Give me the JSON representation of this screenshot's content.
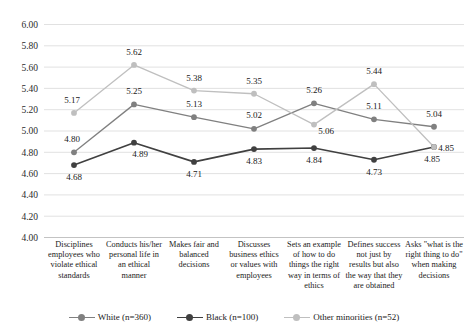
{
  "chart_data": {
    "type": "line",
    "title": "",
    "xlabel": "",
    "ylabel": "",
    "ylim": [
      4.0,
      6.0
    ],
    "ytick_step": 0.2,
    "grid": true,
    "legend_position": "bottom",
    "yticks": [
      "6.00",
      "5.80",
      "5.60",
      "5.40",
      "5.20",
      "5.00",
      "4.80",
      "4.60",
      "4.40",
      "4.20",
      "4.00"
    ],
    "categories": [
      "Disciplines employees who violate ethical standards",
      "Conducts his/her personal life in an ethical manner",
      "Makes fair and balanced decisions",
      "Discusses business ethics or values with employees",
      "Sets an example of how to do things the right way in terms of ethics",
      "Defines success not just by results but also the way that they are obtained",
      "Asks \"what is the right thing to do\" when making decisions"
    ],
    "series": [
      {
        "name": "White (n=360)",
        "color": "#808080",
        "values": [
          4.8,
          5.25,
          5.13,
          5.02,
          5.26,
          5.11,
          5.04
        ],
        "labels": [
          "4.80",
          "5.25",
          "5.13",
          "5.02",
          "5.26",
          "5.11",
          "5.04"
        ]
      },
      {
        "name": "Black (n=100)",
        "color": "#404040",
        "values": [
          4.68,
          4.89,
          4.71,
          4.83,
          4.84,
          4.73,
          4.85
        ],
        "labels": [
          "4.68",
          "4.89",
          "4.71",
          "4.83",
          "4.84",
          "4.73",
          "4.85"
        ]
      },
      {
        "name": "Other minorities (n=52)",
        "color": "#bfbfbf",
        "values": [
          5.17,
          5.62,
          5.38,
          5.35,
          5.06,
          5.44,
          4.85
        ],
        "labels": [
          "5.17",
          "5.62",
          "5.38",
          "5.35",
          "5.06",
          "5.44",
          "4.85"
        ]
      }
    ],
    "label_offsets": [
      [
        [
          -2,
          -10
        ],
        [
          0,
          -10
        ],
        [
          0,
          -10
        ],
        [
          0,
          -11
        ],
        [
          0,
          -10
        ],
        [
          0,
          -10
        ],
        [
          0,
          -10
        ]
      ],
      [
        [
          0,
          15
        ],
        [
          6,
          14
        ],
        [
          0,
          15
        ],
        [
          0,
          15
        ],
        [
          0,
          15
        ],
        [
          0,
          15
        ],
        [
          -2,
          15
        ]
      ],
      [
        [
          -2,
          -10
        ],
        [
          0,
          -10
        ],
        [
          0,
          -10
        ],
        [
          0,
          -10
        ],
        [
          12,
          9
        ],
        [
          0,
          -10
        ],
        [
          12,
          4
        ]
      ]
    ]
  },
  "legend": {
    "items": [
      {
        "label": "White (n=360)",
        "color": "#808080"
      },
      {
        "label": "Black (n=100)",
        "color": "#404040"
      },
      {
        "label": "Other minorities (n=52)",
        "color": "#bfbfbf"
      }
    ]
  }
}
